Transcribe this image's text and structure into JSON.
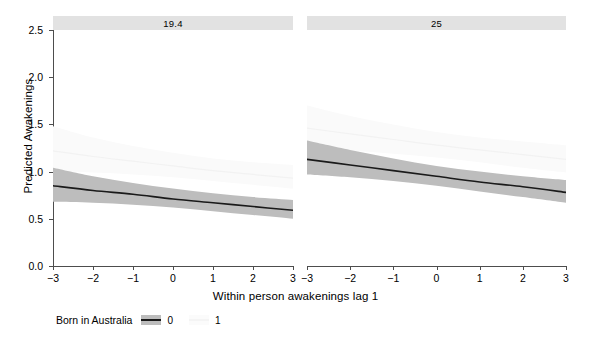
{
  "chart_data": {
    "type": "line",
    "title": "",
    "xlabel": "Within person awakenings lag 1",
    "ylabel": "Predicted Awakenings",
    "ylim": [
      0.0,
      2.5
    ],
    "xlim": [
      -3,
      3
    ],
    "grid": false,
    "legend_position": "bottom-left",
    "legend_title": "Born in Australia",
    "facet_strips": [
      "19.4",
      "25"
    ],
    "y_ticks": [
      "0.0",
      "0.5",
      "1.0",
      "1.5",
      "2.0",
      "2.5"
    ],
    "y_tick_values": [
      0.0,
      0.5,
      1.0,
      1.5,
      2.0,
      2.5
    ],
    "x_ticks": [
      "−3",
      "−2",
      "−1",
      "0",
      "1",
      "2",
      "3"
    ],
    "x_tick_values": [
      -3,
      -2,
      -1,
      0,
      1,
      2,
      3
    ],
    "colors": {
      "line_0": "#1a1a1a",
      "band_0": "#bdbdbd",
      "line_1": "#f2f2f2",
      "band_1": "#fafafa",
      "strip_bg": "#e2e2e2",
      "axis": "#4d4d4d"
    },
    "panels": [
      {
        "strip_label": "19.4",
        "series": [
          {
            "name": "0",
            "x": [
              -3,
              -2,
              -1,
              0,
              1,
              2,
              3
            ],
            "values": [
              0.85,
              0.8,
              0.76,
              0.71,
              0.67,
              0.63,
              0.59
            ],
            "ci_lower": [
              0.68,
              0.67,
              0.65,
              0.62,
              0.58,
              0.54,
              0.5
            ],
            "ci_upper": [
              1.04,
              0.95,
              0.88,
              0.82,
              0.77,
              0.73,
              0.7
            ]
          },
          {
            "name": "1",
            "x": [
              -3,
              -2,
              -1,
              0,
              1,
              2,
              3
            ],
            "values": [
              1.22,
              1.16,
              1.11,
              1.06,
              1.01,
              0.97,
              0.93
            ],
            "ci_lower": [
              1.0,
              0.99,
              0.97,
              0.94,
              0.9,
              0.86,
              0.82
            ],
            "ci_upper": [
              1.48,
              1.36,
              1.27,
              1.2,
              1.14,
              1.1,
              1.07
            ]
          }
        ]
      },
      {
        "strip_label": "25",
        "series": [
          {
            "name": "0",
            "x": [
              -3,
              -2,
              -1,
              0,
              1,
              2,
              3
            ],
            "values": [
              1.13,
              1.07,
              1.01,
              0.95,
              0.89,
              0.84,
              0.78
            ],
            "ci_lower": [
              0.97,
              0.94,
              0.9,
              0.85,
              0.79,
              0.73,
              0.67
            ],
            "ci_upper": [
              1.33,
              1.23,
              1.14,
              1.06,
              1.0,
              0.95,
              0.91
            ]
          },
          {
            "name": "1",
            "x": [
              -3,
              -2,
              -1,
              0,
              1,
              2,
              3
            ],
            "values": [
              1.46,
              1.4,
              1.34,
              1.28,
              1.23,
              1.18,
              1.13
            ],
            "ci_lower": [
              1.24,
              1.22,
              1.19,
              1.15,
              1.1,
              1.04,
              0.99
            ],
            "ci_upper": [
              1.7,
              1.59,
              1.5,
              1.42,
              1.36,
              1.32,
              1.28
            ]
          }
        ]
      }
    ]
  },
  "legend": {
    "title": "Born in Australia",
    "items": [
      {
        "label": "0",
        "color": "#1a1a1a",
        "band": "#bdbdbd"
      },
      {
        "label": "1",
        "color": "#f4f4f4",
        "band": "#fbfbfb"
      }
    ]
  }
}
